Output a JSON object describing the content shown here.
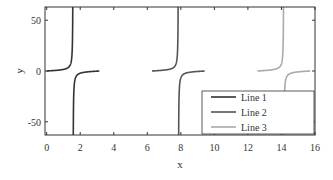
{
  "chart_data": {
    "type": "line",
    "title": "",
    "xlabel": "x",
    "ylabel": "y",
    "xlim": [
      -0.1,
      16
    ],
    "ylim": [
      -63,
      63
    ],
    "xticks": [
      0,
      2,
      4,
      6,
      8,
      10,
      12,
      14,
      16
    ],
    "yticks": [
      -50,
      0,
      50
    ],
    "grid": false,
    "legend_position": "lower right",
    "series": [
      {
        "name": "Line 1",
        "color": "#333333",
        "function": "tan(x)",
        "x_range": [
          0,
          3.14
        ],
        "asymptote": 1.5708
      },
      {
        "name": "Line 2",
        "color": "#555555",
        "function": "tan(x)",
        "x_range": [
          6.28,
          9.42
        ],
        "asymptote": 7.854
      },
      {
        "name": "Line 3",
        "color": "#aaaaaa",
        "function": "tan(x)",
        "x_range": [
          12.57,
          15.71
        ],
        "asymptote": 14.137
      }
    ]
  },
  "labels": {
    "xlabel": "x",
    "ylabel": "y",
    "xticks": [
      "0",
      "2",
      "4",
      "6",
      "8",
      "10",
      "12",
      "14",
      "16"
    ],
    "yticks": [
      "50",
      "0",
      "-50"
    ],
    "legend": [
      "Line 1",
      "Line 2",
      "Line 3"
    ]
  }
}
